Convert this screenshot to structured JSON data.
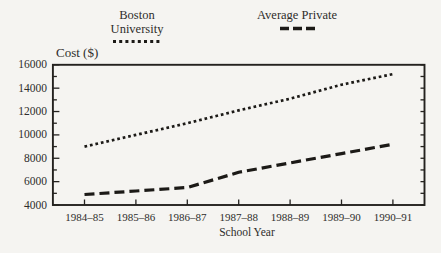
{
  "chart_data": {
    "type": "line",
    "title": "",
    "ylabel": "Cost ($)",
    "xlabel": "School Year",
    "categories": [
      "1984–85",
      "1985–86",
      "1986–87",
      "1987–88",
      "1988–89",
      "1989–90",
      "1990–91"
    ],
    "series": [
      {
        "name": "Boston University",
        "line_style": "dotted",
        "color": "#1c1a17",
        "values": [
          9000,
          10000,
          11000,
          12100,
          13100,
          14300,
          15200
        ]
      },
      {
        "name": "Average Private",
        "line_style": "dashed",
        "color": "#1c1a17",
        "values": [
          4900,
          5200,
          5500,
          6800,
          7600,
          8400,
          9200
        ]
      }
    ],
    "ylim": [
      4000,
      16000
    ],
    "y_major_ticks": [
      16000,
      14000,
      12000,
      10000,
      8000,
      6000,
      4000
    ],
    "y_minor_step": 1000,
    "grid": false,
    "legend_position": "top",
    "colors": {
      "axis": "#24221f",
      "text": "#2e2d2b",
      "background": "#f5f4f1"
    }
  }
}
